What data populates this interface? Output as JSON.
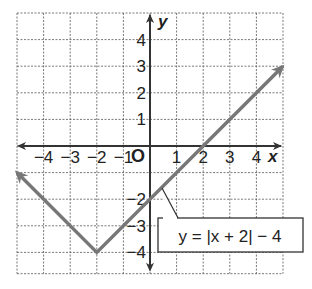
{
  "chart_data": {
    "type": "line",
    "title": "",
    "equation_label": "y = |x + 2| − 4",
    "xlabel": "x",
    "ylabel": "y",
    "xlim": [
      -5,
      5
    ],
    "ylim": [
      -4.8,
      5
    ],
    "grid": true,
    "x_ticks": [
      "−4",
      "−3",
      "−2",
      "−1",
      "1",
      "2",
      "3",
      "4"
    ],
    "y_ticks": [
      "4",
      "3",
      "2",
      "1",
      "−2",
      "−3",
      "−4"
    ],
    "origin_label": "O",
    "series": [
      {
        "name": "y = |x + 2| − 4",
        "points": [
          [
            -5,
            -1
          ],
          [
            -2,
            -4
          ],
          [
            5,
            3
          ]
        ],
        "arrows_both_ends": true,
        "color": "#777777"
      }
    ],
    "vertex": [
      -2,
      -4
    ]
  },
  "labels": {
    "x_axis": "x",
    "y_axis": "y",
    "origin": "O",
    "equation": "y = |x + 2| − 4",
    "x_ticks": [
      {
        "v": -4,
        "t": "−4"
      },
      {
        "v": -3,
        "t": "−3"
      },
      {
        "v": -2,
        "t": "−2"
      },
      {
        "v": -1,
        "t": "−1"
      },
      {
        "v": 1,
        "t": "1"
      },
      {
        "v": 2,
        "t": "2"
      },
      {
        "v": 3,
        "t": "3"
      },
      {
        "v": 4,
        "t": "4"
      }
    ],
    "y_ticks": [
      {
        "v": 4,
        "t": "4"
      },
      {
        "v": 3,
        "t": "3"
      },
      {
        "v": 2,
        "t": "2"
      },
      {
        "v": 1,
        "t": "1"
      },
      {
        "v": -2,
        "t": "−2"
      },
      {
        "v": -3,
        "t": "−3"
      },
      {
        "v": -4,
        "t": "−4"
      }
    ]
  }
}
